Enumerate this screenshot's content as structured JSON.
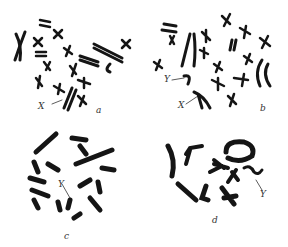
{
  "figure": {
    "panels": [
      {
        "id": "a",
        "label": "a",
        "annotations": [
          "X"
        ]
      },
      {
        "id": "b",
        "label": "b",
        "annotations": [
          "Y",
          "X"
        ]
      },
      {
        "id": "c",
        "label": "c",
        "annotations": [
          "Y"
        ]
      },
      {
        "id": "d",
        "label": "d",
        "annotations": [
          "Y"
        ]
      }
    ],
    "colors": {
      "chromosome": "#151515",
      "background": "#ffffff",
      "label": "#333333"
    }
  }
}
